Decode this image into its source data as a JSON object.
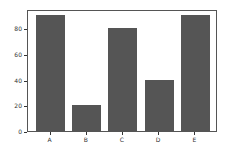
{
  "chart_data": {
    "type": "bar",
    "title": "",
    "xlabel": "",
    "ylabel": "",
    "categories": [
      "A",
      "B",
      "C",
      "D",
      "E"
    ],
    "values": [
      90,
      20,
      80,
      40,
      90
    ],
    "ylim": [
      0,
      95
    ],
    "yticks": [
      "0",
      "20",
      "40",
      "60",
      "80"
    ],
    "grid": false,
    "bar_color": "#555555"
  }
}
